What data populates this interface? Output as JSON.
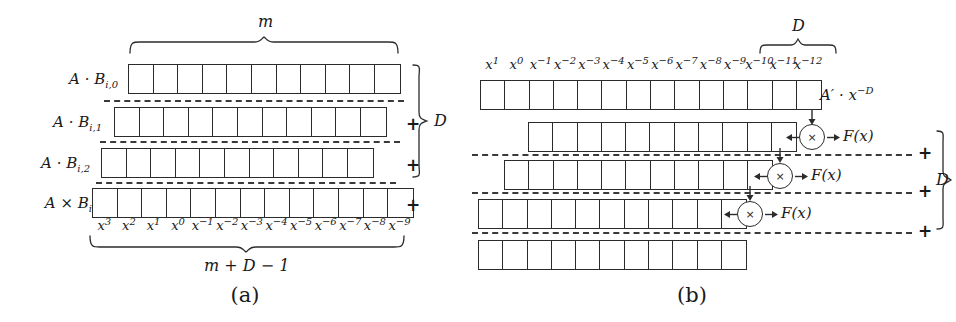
{
  "figure": {
    "panels": [
      {
        "id": "a",
        "caption": "(a)",
        "top_brace_label": "m",
        "bottom_brace_label": "m + D − 1",
        "side_brace_label": "D",
        "rows": [
          {
            "label_base": "A · B",
            "label_sub": "i,0",
            "cells": 11,
            "offset": 0
          },
          {
            "label_base": "A · B",
            "label_sub": "i,1",
            "cells": 11,
            "offset": 1
          },
          {
            "label_base": "A · B",
            "label_sub": "i,2",
            "cells": 11,
            "offset": 2
          },
          {
            "label_base": "A × B",
            "label_sub": "i",
            "cells": 13,
            "offset": 0
          }
        ],
        "plus_signs": [
          "+",
          "+",
          "+"
        ],
        "exponents": [
          {
            "base": "x",
            "exp": "3"
          },
          {
            "base": "x",
            "exp": "2"
          },
          {
            "base": "x",
            "exp": "1"
          },
          {
            "base": "x",
            "exp": "0"
          },
          {
            "base": "x",
            "exp": "−1"
          },
          {
            "base": "x",
            "exp": "−2"
          },
          {
            "base": "x",
            "exp": "−3"
          },
          {
            "base": "x",
            "exp": "−4"
          },
          {
            "base": "x",
            "exp": "−5"
          },
          {
            "base": "x",
            "exp": "−6"
          },
          {
            "base": "x",
            "exp": "−7"
          },
          {
            "base": "x",
            "exp": "−8"
          },
          {
            "base": "x",
            "exp": "−9"
          }
        ]
      },
      {
        "id": "b",
        "caption": "(b)",
        "top_brace_label": "D",
        "side_brace_label": "D",
        "first_row_label_base": "A′ · x",
        "first_row_label_exp": "−D",
        "multiplier_symbol": "×",
        "mult_labels": [
          "F(x)",
          "F(x)",
          "F(x)"
        ],
        "plus_signs": [
          "+",
          "+",
          "+"
        ],
        "rows": [
          {
            "cells": 14,
            "offset": 0
          },
          {
            "cells": 11,
            "offset": 2
          },
          {
            "cells": 11,
            "offset": 1
          },
          {
            "cells": 11,
            "offset": 0
          },
          {
            "cells": 11,
            "offset": 0
          }
        ],
        "exponents": [
          {
            "base": "x",
            "exp": "1"
          },
          {
            "base": "x",
            "exp": "0"
          },
          {
            "base": "x",
            "exp": "−1"
          },
          {
            "base": "x",
            "exp": "−2"
          },
          {
            "base": "x",
            "exp": "−3"
          },
          {
            "base": "x",
            "exp": "−4"
          },
          {
            "base": "x",
            "exp": "−5"
          },
          {
            "base": "x",
            "exp": "−6"
          },
          {
            "base": "x",
            "exp": "−7"
          },
          {
            "base": "x",
            "exp": "−8"
          },
          {
            "base": "x",
            "exp": "−9"
          },
          {
            "base": "x",
            "exp": "−10"
          },
          {
            "base": "x",
            "exp": "−11"
          },
          {
            "base": "x",
            "exp": "−12"
          }
        ]
      }
    ]
  },
  "colors": {
    "ink": "#1a1a1a",
    "line": "#2b2b2b",
    "dash": "#3a3a3a",
    "background": "#ffffff"
  }
}
